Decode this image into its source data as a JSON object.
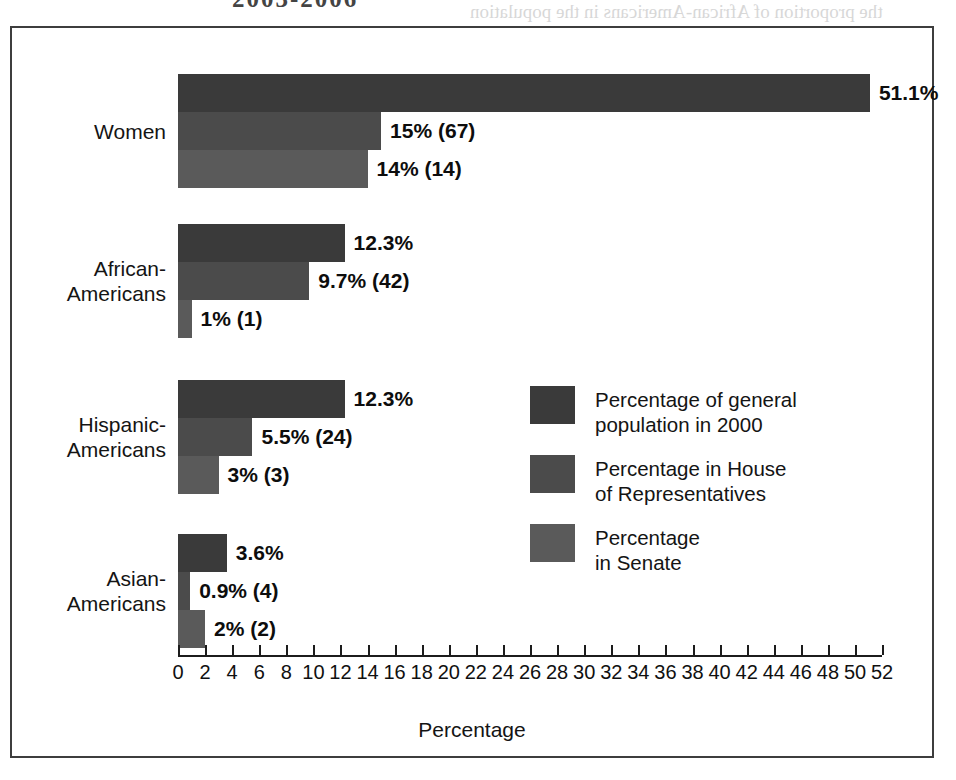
{
  "page": {
    "bleed_title": "2003-2006",
    "bleed_text_1": "the proportion of African-Americans in the population",
    "bleed_text_2": "of African-American representatives"
  },
  "chart_data": {
    "type": "bar",
    "orientation": "horizontal",
    "title": "",
    "xlabel": "Percentage",
    "ylabel": "",
    "xlim": [
      0,
      52
    ],
    "xtick_step": 2,
    "grid": false,
    "legend_position": "center-right",
    "categories": [
      "Women",
      "African-Americans",
      "Hispanic-Americans",
      "Asian-Americans"
    ],
    "series": [
      {
        "name": "Percentage of general\npopulation in 2000",
        "key": "general-population",
        "color": "#3a3a3a",
        "values": [
          51.1,
          12.3,
          12.3,
          3.6
        ],
        "labels": [
          "51.1%",
          "12.3%",
          "12.3%",
          "3.6%"
        ]
      },
      {
        "name": "Percentage in House\nof Representatives",
        "key": "house",
        "color": "#4b4b4b",
        "values": [
          15,
          9.7,
          5.5,
          0.9
        ],
        "labels": [
          "15% (67)",
          "9.7% (42)",
          "5.5% (24)",
          "0.9% (4)"
        ]
      },
      {
        "name": "Percentage\nin Senate",
        "key": "senate",
        "color": "#5a5a5a",
        "values": [
          14,
          1,
          3,
          2
        ],
        "labels": [
          "14% (14)",
          "1% (1)",
          "3% (3)",
          "2% (2)"
        ]
      }
    ],
    "xticks": [
      0,
      2,
      4,
      6,
      8,
      10,
      12,
      14,
      16,
      18,
      20,
      22,
      24,
      26,
      28,
      30,
      32,
      34,
      36,
      38,
      40,
      42,
      44,
      46,
      48,
      50,
      52
    ]
  },
  "layout": {
    "px_per_unit": 13.54,
    "group_tops": [
      46,
      196,
      352,
      506
    ],
    "bar_height": 38,
    "frame_color": "#3d3d3d"
  }
}
